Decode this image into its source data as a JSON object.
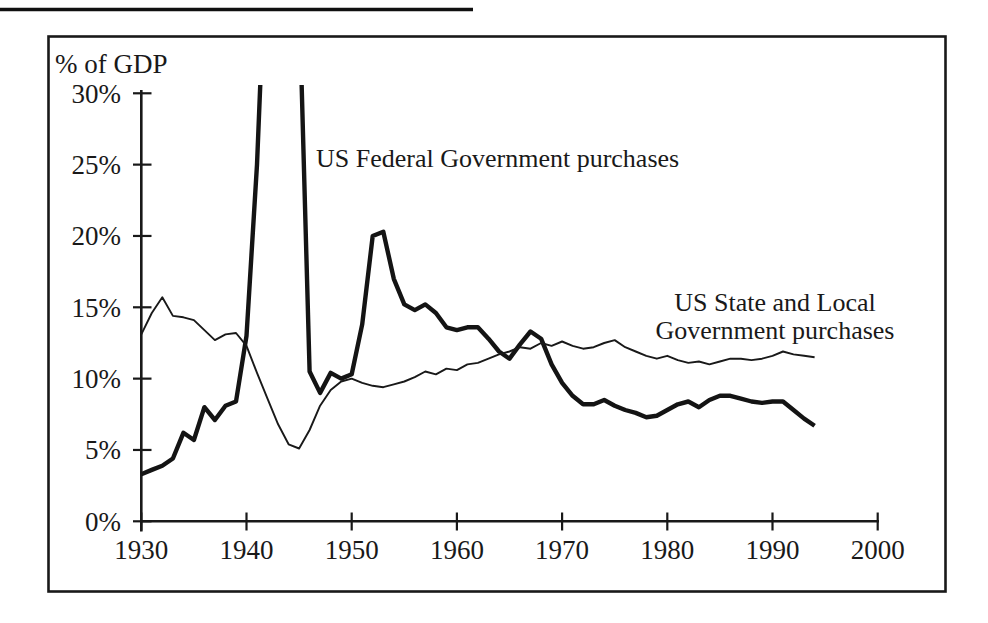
{
  "figure": {
    "y_axis_title": "% of GDP",
    "federal_label": "US Federal Government purchases",
    "state_local_label_line1": "US State and Local",
    "state_local_label_line2": "Government purchases",
    "ink_color": "#191919"
  },
  "chart_data": {
    "type": "line",
    "title": "",
    "xlabel": "",
    "ylabel": "% of GDP",
    "xlim": [
      1930,
      2000
    ],
    "ylim": [
      0,
      30
    ],
    "grid": false,
    "legend_position": "inline-annotations",
    "x_ticks": [
      1930,
      1940,
      1950,
      1960,
      1970,
      1980,
      1990,
      2000
    ],
    "y_ticks": [
      0,
      5,
      10,
      15,
      20,
      25,
      30
    ],
    "y_tick_labels": [
      "0%",
      "5%",
      "10%",
      "15%",
      "20%",
      "25%",
      "30%"
    ],
    "years": [
      1930,
      1931,
      1932,
      1933,
      1934,
      1935,
      1936,
      1937,
      1938,
      1939,
      1940,
      1941,
      1942,
      1943,
      1944,
      1945,
      1946,
      1947,
      1948,
      1949,
      1950,
      1951,
      1952,
      1953,
      1954,
      1955,
      1956,
      1957,
      1958,
      1959,
      1960,
      1961,
      1962,
      1963,
      1964,
      1965,
      1966,
      1967,
      1968,
      1969,
      1970,
      1971,
      1972,
      1973,
      1974,
      1975,
      1976,
      1977,
      1978,
      1979,
      1980,
      1981,
      1982,
      1983,
      1984,
      1985,
      1986,
      1987,
      1988,
      1989,
      1990,
      1991,
      1992,
      1993,
      1994
    ],
    "series": [
      {
        "name": "US Federal Government purchases",
        "line": "thick",
        "note": "values 1942-1945 exceed the 30% axis maximum and are clipped at the top of the plot",
        "values": [
          3.3,
          3.6,
          3.9,
          4.4,
          6.2,
          5.7,
          8.0,
          7.1,
          8.1,
          8.4,
          13.0,
          25.0,
          43.0,
          46.0,
          45.0,
          37.0,
          10.5,
          9.0,
          10.4,
          10.0,
          10.3,
          13.8,
          20.0,
          20.3,
          17.0,
          15.2,
          14.8,
          15.2,
          14.6,
          13.6,
          13.4,
          13.6,
          13.6,
          12.8,
          11.9,
          11.4,
          12.4,
          13.3,
          12.8,
          11.0,
          9.7,
          8.8,
          8.2,
          8.2,
          8.5,
          8.1,
          7.8,
          7.6,
          7.3,
          7.4,
          7.8,
          8.2,
          8.4,
          8.0,
          8.5,
          8.8,
          8.8,
          8.6,
          8.4,
          8.3,
          8.4,
          8.4,
          7.8,
          7.2,
          6.7
        ]
      },
      {
        "name": "US State and Local Government purchases",
        "line": "thin",
        "values": [
          13.1,
          14.6,
          15.7,
          14.4,
          14.3,
          14.1,
          13.4,
          12.7,
          13.1,
          13.2,
          12.3,
          10.4,
          8.6,
          6.8,
          5.4,
          5.1,
          6.4,
          8.1,
          9.2,
          9.8,
          10.0,
          9.7,
          9.5,
          9.4,
          9.6,
          9.8,
          10.1,
          10.5,
          10.3,
          10.7,
          10.6,
          11.0,
          11.1,
          11.4,
          11.7,
          11.9,
          12.2,
          12.1,
          12.5,
          12.3,
          12.6,
          12.3,
          12.1,
          12.2,
          12.5,
          12.7,
          12.2,
          11.9,
          11.6,
          11.4,
          11.6,
          11.3,
          11.1,
          11.2,
          11.0,
          11.2,
          11.4,
          11.4,
          11.3,
          11.4,
          11.6,
          11.9,
          11.7,
          11.6,
          11.5
        ]
      }
    ]
  }
}
